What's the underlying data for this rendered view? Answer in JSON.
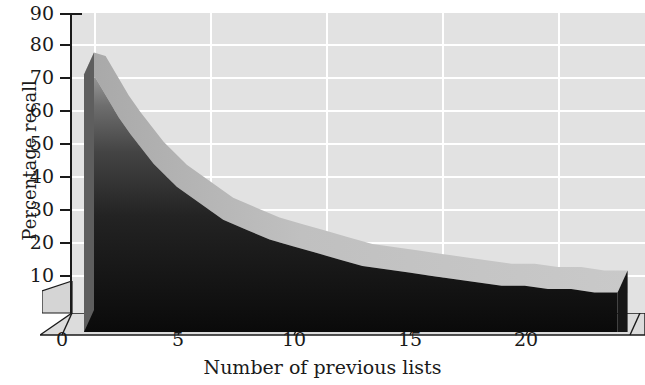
{
  "chart_data": {
    "type": "area",
    "title": "",
    "subtitle": "",
    "xlabel": "Number of previous lists",
    "ylabel": "Percentage recall",
    "xlim": [
      0,
      23
    ],
    "ylim": [
      0,
      90
    ],
    "x_ticks": [
      "0",
      "5",
      "10",
      "15",
      "20"
    ],
    "x_tick_values": [
      0,
      5,
      10,
      15,
      20
    ],
    "y_ticks": [
      "10",
      "20",
      "30",
      "40",
      "50",
      "60",
      "70",
      "80",
      "90"
    ],
    "y_tick_values": [
      10,
      20,
      30,
      40,
      50,
      60,
      70,
      80,
      90
    ],
    "grid": true,
    "legend": null,
    "legend_position": "none",
    "projection": "3d-ribbon",
    "series": [
      {
        "name": "Percentage recall",
        "x": [
          0,
          0.5,
          1,
          1.5,
          2,
          3,
          4,
          5,
          6,
          7,
          8,
          9,
          10,
          11,
          12,
          13,
          14,
          15,
          16,
          17,
          18,
          19,
          20,
          21,
          22,
          23
        ],
        "values": [
          78,
          77,
          71,
          65,
          60,
          51,
          44,
          39,
          34,
          31,
          28,
          26,
          24,
          22,
          20,
          19,
          18,
          17,
          16,
          15,
          14,
          14,
          13,
          13,
          12,
          12
        ]
      }
    ],
    "annotations": [],
    "colors": {
      "panel_background": "#e2e2e2",
      "gridline": "#ffffff",
      "surface_top": "#bfbfbf",
      "front_face_top": "#8c8c8c",
      "front_face_bottom": "#0d0d0d",
      "right_face": "#1a1a1a",
      "floor": "#d9d9d9",
      "axis": "#1a1a1a",
      "text": "#1a1a1a"
    }
  },
  "axes": {
    "y_title": "Percentage recall",
    "x_title": "Number of previous lists"
  },
  "figure": {
    "width": 645,
    "height": 385,
    "background": "#ffffff"
  }
}
